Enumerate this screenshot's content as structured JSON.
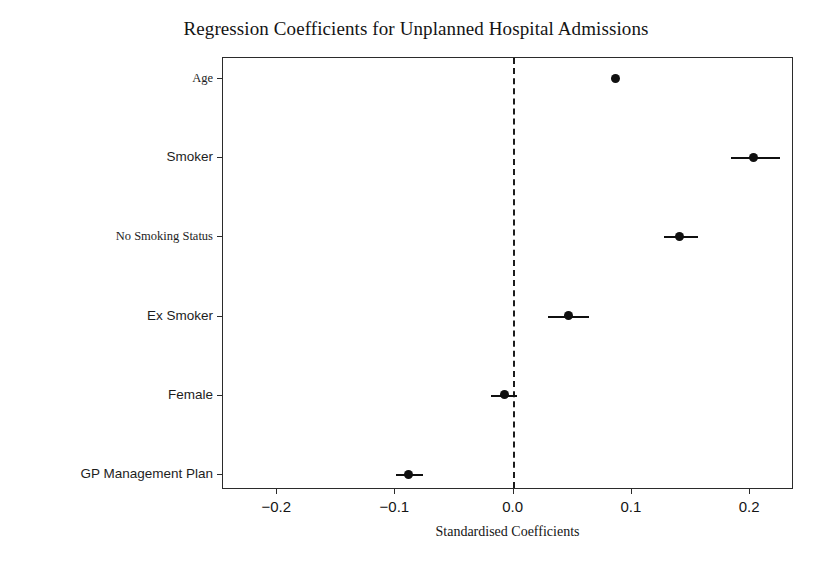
{
  "chart_data": {
    "type": "scatter",
    "title": "Regression Coefficients for Unplanned Hospital Admissions",
    "xlabel": "Standardised Coefficients",
    "ylabel": "",
    "xlim": [
      -0.245,
      0.238
    ],
    "ylim": [
      -0.6,
      5.6
    ],
    "grid": false,
    "legend": "none",
    "orientation": "horizontal",
    "reference_line": {
      "x": 0.0,
      "style": "dashed",
      "color": "#1b1b1b"
    },
    "marker_color": "#101010",
    "xticks": [
      "−0.2",
      "−0.1",
      "0.0",
      "0.1",
      "0.2"
    ],
    "xtick_values": [
      -0.2,
      -0.1,
      0.0,
      0.1,
      0.2
    ],
    "categories": [
      "Age",
      "Smoker",
      "No Smoking Status",
      "Ex Smoker",
      "Female",
      "GP Management Plan"
    ],
    "values": [
      0.087,
      0.204,
      0.141,
      0.047,
      -0.007,
      -0.088
    ],
    "ci_low": [
      0.084,
      0.185,
      0.128,
      0.03,
      -0.018,
      -0.099
    ],
    "ci_high": [
      0.09,
      0.226,
      0.157,
      0.065,
      0.004,
      -0.076
    ],
    "points": [
      {
        "label": "Age",
        "value": 0.087,
        "ci_low": 0.084,
        "ci_high": 0.09
      },
      {
        "label": "Smoker",
        "value": 0.204,
        "ci_low": 0.185,
        "ci_high": 0.226
      },
      {
        "label": "No Smoking Status",
        "value": 0.141,
        "ci_low": 0.128,
        "ci_high": 0.157
      },
      {
        "label": "Ex Smoker",
        "value": 0.047,
        "ci_low": 0.03,
        "ci_high": 0.065
      },
      {
        "label": "Female",
        "value": -0.007,
        "ci_low": -0.018,
        "ci_high": 0.004
      },
      {
        "label": "GP Management Plan",
        "value": -0.088,
        "ci_low": -0.099,
        "ci_high": -0.076
      }
    ]
  }
}
